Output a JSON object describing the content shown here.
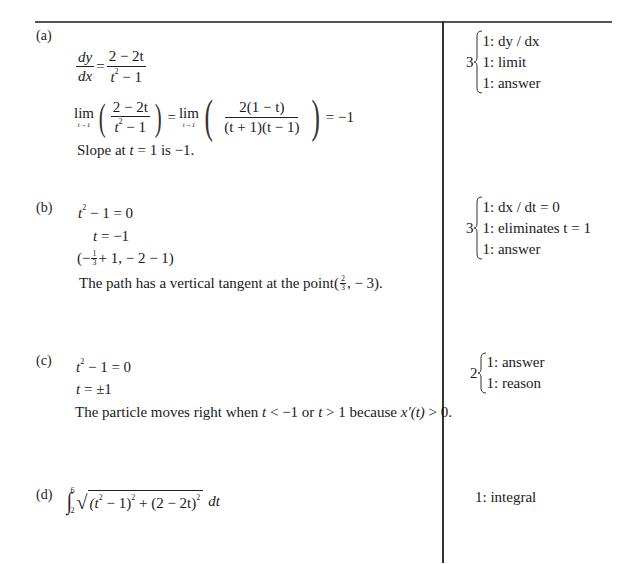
{
  "parts": [
    {
      "label": "(a)",
      "work": {
        "deriv_lhs_num": "dy",
        "deriv_lhs_den": "dx",
        "deriv_rhs_num": "2 − 2t",
        "deriv_rhs_den_base": "t",
        "deriv_rhs_den_exp": "2",
        "deriv_rhs_den_rest": " − 1",
        "lim_word": "lim",
        "lim_sub": "t→1",
        "lim_frac1_num": "2 − 2t",
        "lim_frac1_den_base": "t",
        "lim_frac1_den_exp": "2",
        "lim_frac1_den_rest": " − 1",
        "lim_frac2_num": "2(1 − t)",
        "lim_frac2_den": "(t + 1)(t − 1)",
        "lim_result": "= −1",
        "conclusion_prefix": "Slope at ",
        "conclusion_var": "t",
        "conclusion_suffix": " = 1 is  −1."
      },
      "scoring": {
        "points": "3",
        "items": [
          "1:  dy / dx",
          "1:  limit",
          "1:  answer"
        ]
      }
    },
    {
      "label": "(b)",
      "work": {
        "line1_base": "t",
        "line1_exp": "2",
        "line1_rest": " − 1 = 0",
        "line2_var": "t",
        "line2_rest": " = −1",
        "point_open": "(−",
        "point_frac_num": "1",
        "point_frac_den": "3",
        "point_rest": "+ 1, − 2 − 1)",
        "conclusion_prefix": "The path has a vertical tangent at the point ",
        "conclusion_frac_num": "2",
        "conclusion_frac_den": "3",
        "conclusion_rest": ", − 3)."
      },
      "scoring": {
        "points": "3",
        "items": [
          "1:  dx / dt = 0",
          "1:  eliminates t = 1",
          "1:  answer"
        ]
      }
    },
    {
      "label": "(c)",
      "work": {
        "line1_base": "t",
        "line1_exp": "2",
        "line1_rest": " − 1 = 0",
        "line2_var": "t",
        "line2_rest": " = ±1",
        "conclusion_prefix": "The particle moves right when ",
        "conclusion_middle": " < −1 or ",
        "conclusion_middle2": " > 1 because ",
        "conclusion_deriv": "x′(t)",
        "conclusion_suffix": " > 0."
      },
      "scoring": {
        "points": "2",
        "items": [
          "1: answer",
          "1: reason"
        ]
      }
    },
    {
      "label": "(d)",
      "work": {
        "integral_upper": "6",
        "integral_lower": "2",
        "integrand_part1": "(t",
        "integrand_part1_exp": "2",
        "integrand_part1_close": " − 1)",
        "integrand_part1_outer_exp": "2",
        "integrand_plus": " + (2 − 2t)",
        "integrand_part2_outer_exp": "2",
        "differential": "dt"
      },
      "scoring": {
        "points": "",
        "items": [
          "1: integral"
        ]
      }
    }
  ]
}
